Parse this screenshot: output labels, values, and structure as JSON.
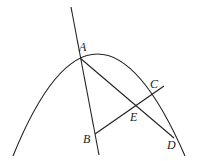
{
  "figure": {
    "points": {
      "A": {
        "label": "A",
        "x": 80,
        "y": 58,
        "lx": 80,
        "ly": 49
      },
      "B": {
        "label": "B",
        "x": 95,
        "y": 134,
        "lx": 83,
        "ly": 143
      },
      "C": {
        "label": "C",
        "x": 151,
        "y": 94,
        "lx": 150,
        "ly": 88
      },
      "D": {
        "label": "D",
        "x": 174,
        "y": 138,
        "lx": 167,
        "ly": 148
      },
      "E": {
        "label": "E",
        "x": 137,
        "y": 105,
        "lx": 130,
        "ly": 121
      }
    },
    "colors": {
      "stroke": "#222222",
      "background": "#ffffff"
    }
  }
}
